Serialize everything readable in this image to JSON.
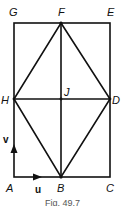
{
  "figure": {
    "caption": "Fig. 49.7",
    "points": {
      "A": {
        "label": "A",
        "x": 14,
        "y": 177
      },
      "B": {
        "label": "B",
        "x": 61,
        "y": 177
      },
      "C": {
        "label": "C",
        "x": 110,
        "y": 177
      },
      "D": {
        "label": "D",
        "x": 110,
        "y": 99
      },
      "E": {
        "label": "E",
        "x": 110,
        "y": 23
      },
      "F": {
        "label": "F",
        "x": 61,
        "y": 23
      },
      "G": {
        "label": "G",
        "x": 14,
        "y": 23
      },
      "H": {
        "label": "H",
        "x": 14,
        "y": 99
      },
      "J": {
        "label": "J",
        "x": 61,
        "y": 99
      }
    },
    "vectors": {
      "u": {
        "label": "u"
      },
      "v": {
        "label": "v"
      }
    },
    "colors": {
      "line": "#111111",
      "background": "#ffffff"
    }
  }
}
